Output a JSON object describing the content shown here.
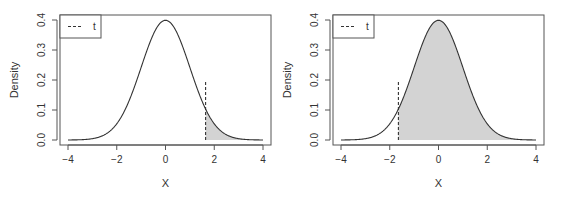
{
  "chart_data": [
    {
      "type": "area",
      "title": "",
      "xlabel": "X",
      "ylabel": "Density",
      "xlim": [
        -4,
        4
      ],
      "ylim": [
        0,
        0.4
      ],
      "x_ticks": [
        "-4",
        "-2",
        "0",
        "2",
        "4"
      ],
      "y_ticks": [
        "0.0",
        "0.1",
        "0.2",
        "0.3",
        "0.4"
      ],
      "grid": false,
      "legend": {
        "position": "topleft",
        "entries": [
          {
            "label": "t",
            "style": "dashed"
          }
        ]
      },
      "series": [
        {
          "name": "standard normal density",
          "function": "dnorm(x)",
          "x_range": [
            -4,
            4
          ]
        }
      ],
      "t_value": 1.645,
      "t_line_height": 0.2,
      "shaded_region": {
        "from": 1.645,
        "to": 4,
        "description": "upper tail beyond t"
      }
    },
    {
      "type": "area",
      "title": "",
      "xlabel": "X",
      "ylabel": "Density",
      "xlim": [
        -4,
        4
      ],
      "ylim": [
        0,
        0.4
      ],
      "x_ticks": [
        "-4",
        "-2",
        "0",
        "2",
        "4"
      ],
      "y_ticks": [
        "0.0",
        "0.1",
        "0.2",
        "0.3",
        "0.4"
      ],
      "grid": false,
      "legend": {
        "position": "topleft",
        "entries": [
          {
            "label": "t",
            "style": "dashed"
          }
        ]
      },
      "series": [
        {
          "name": "standard normal density",
          "function": "dnorm(x)",
          "x_range": [
            -4,
            4
          ]
        }
      ],
      "t_value": -1.645,
      "t_line_height": 0.2,
      "shaded_region": {
        "from": -1.645,
        "to": 4,
        "description": "region above t"
      }
    }
  ],
  "colors": {
    "curve": "#333333",
    "shade": "#d3d3d3",
    "axis": "#555555",
    "text": "#333333"
  }
}
